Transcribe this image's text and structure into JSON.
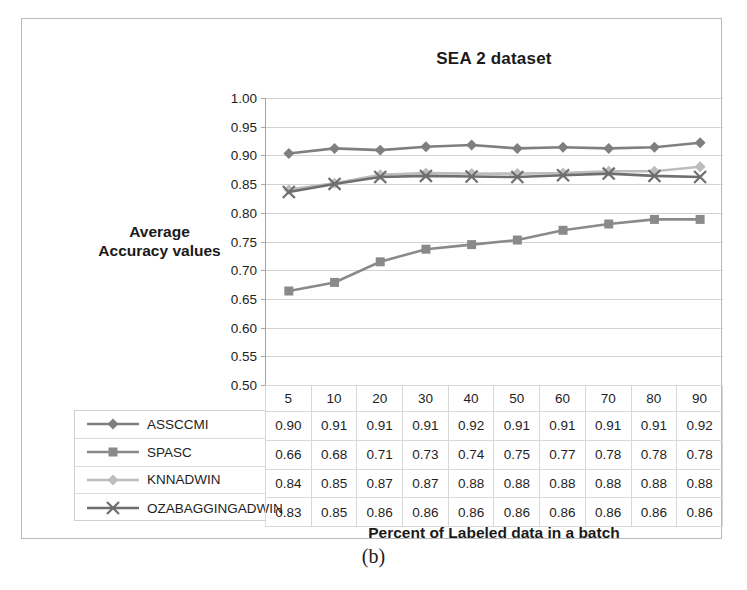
{
  "figure": {
    "caption": "(b)"
  },
  "chart_data": {
    "type": "line",
    "title": "SEA 2 dataset",
    "xlabel": "Percent of Labeled data in a batch",
    "ylabel": "Average\nAccuracy values",
    "ylabel_line1": "Average",
    "ylabel_line2": "Accuracy values",
    "categories": [
      "5",
      "10",
      "20",
      "30",
      "40",
      "50",
      "60",
      "70",
      "80",
      "90"
    ],
    "ylim": [
      0.5,
      1.0
    ],
    "ytick_labels": [
      "1.00",
      "0.95",
      "0.90",
      "0.85",
      "0.80",
      "0.75",
      "0.70",
      "0.65",
      "0.60",
      "0.55",
      "0.50"
    ],
    "ytick_values": [
      1.0,
      0.95,
      0.9,
      0.85,
      0.8,
      0.75,
      0.7,
      0.65,
      0.6,
      0.55,
      0.5
    ],
    "grid": true,
    "legend_position": "table-left",
    "series": [
      {
        "name": "ASSCCMI",
        "marker": "diamond",
        "color": "#7f7f7f",
        "values": [
          0.9,
          0.91,
          0.91,
          0.91,
          0.92,
          0.91,
          0.91,
          0.91,
          0.91,
          0.92
        ],
        "plot_values": [
          0.903,
          0.912,
          0.909,
          0.915,
          0.918,
          0.912,
          0.914,
          0.912,
          0.914,
          0.922
        ]
      },
      {
        "name": "SPASC",
        "marker": "square",
        "color": "#8a8a8a",
        "values": [
          0.66,
          0.68,
          0.71,
          0.73,
          0.74,
          0.75,
          0.77,
          0.78,
          0.78,
          0.78
        ],
        "plot_values": [
          0.663,
          0.678,
          0.714,
          0.736,
          0.744,
          0.752,
          0.769,
          0.78,
          0.788,
          0.788
        ]
      },
      {
        "name": "KNNADWIN",
        "marker": "diamond",
        "color": "#bdbdbd",
        "values": [
          0.84,
          0.85,
          0.87,
          0.87,
          0.88,
          0.88,
          0.88,
          0.88,
          0.88,
          0.88
        ],
        "plot_values": [
          0.84,
          0.851,
          0.866,
          0.869,
          0.868,
          0.868,
          0.869,
          0.872,
          0.872,
          0.88
        ]
      },
      {
        "name": "OZABAGGINGADWIN",
        "marker": "cross",
        "color": "#6e6e6e",
        "values": [
          0.83,
          0.85,
          0.86,
          0.86,
          0.86,
          0.86,
          0.86,
          0.86,
          0.86,
          0.86
        ],
        "plot_values": [
          0.836,
          0.85,
          0.862,
          0.864,
          0.863,
          0.862,
          0.865,
          0.868,
          0.864,
          0.862
        ]
      }
    ]
  },
  "colors": {
    "grid": "#d2d2d2",
    "axis": "#a6a6a6",
    "table_border": "#d8d8d8",
    "frame": "#b9b9b9"
  }
}
